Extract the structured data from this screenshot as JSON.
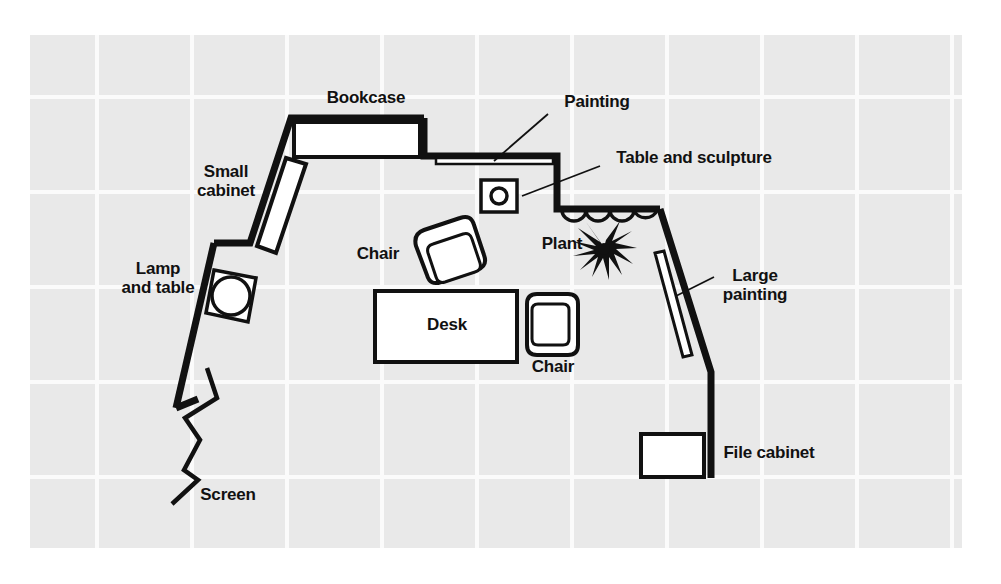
{
  "diagram": {
    "type": "floor-plan",
    "background": {
      "paper_color": "#ffffff",
      "grid_fill": "#e8e8e8",
      "grid_line_color": "#fbfbfb",
      "grid_cell_px": 95,
      "area": {
        "x": 30,
        "y": 35,
        "width": 932,
        "height": 513
      }
    },
    "stroke_color": "#111111",
    "wall_thickness_px": 7,
    "labels": [
      {
        "id": "bookcase",
        "text": "Bookcase",
        "x": 366,
        "y": 97,
        "align": "center"
      },
      {
        "id": "painting",
        "text": "Painting",
        "x": 597,
        "y": 101,
        "align": "center"
      },
      {
        "id": "table-and-sculpture",
        "text": "Table and sculpture",
        "x": 694,
        "y": 157,
        "align": "center"
      },
      {
        "id": "small-cabinet",
        "text": "Small\ncabinet",
        "x": 226,
        "y": 171,
        "align": "center"
      },
      {
        "id": "lamp-and-table",
        "text": "Lamp\nand table",
        "x": 158,
        "y": 268,
        "align": "center"
      },
      {
        "id": "chair-top",
        "text": "Chair",
        "x": 378,
        "y": 253,
        "align": "center"
      },
      {
        "id": "plant",
        "text": "Plant",
        "x": 562,
        "y": 243,
        "align": "center"
      },
      {
        "id": "large-painting",
        "text": "Large\npainting",
        "x": 755,
        "y": 275,
        "align": "center"
      },
      {
        "id": "desk",
        "text": "Desk",
        "x": 447,
        "y": 324,
        "align": "center"
      },
      {
        "id": "chair-right",
        "text": "Chair",
        "x": 553,
        "y": 366,
        "align": "center"
      },
      {
        "id": "file-cabinet",
        "text": "File cabinet",
        "x": 769,
        "y": 452,
        "align": "center"
      },
      {
        "id": "screen",
        "text": "Screen",
        "x": 228,
        "y": 494,
        "align": "center"
      }
    ],
    "furniture": [
      {
        "id": "bookcase",
        "shape": "rectangle",
        "note": "long rectangle along top wall"
      },
      {
        "id": "small-cabinet",
        "shape": "rectangle",
        "note": "tilted rectangle on angled upper-left wall"
      },
      {
        "id": "lamp-and-table",
        "shape": "square-with-circle",
        "note": "square table with round lamp"
      },
      {
        "id": "painting",
        "shape": "thin-strip",
        "note": "thin strip on upper-right wall"
      },
      {
        "id": "table-and-sculpture",
        "shape": "square-with-circle",
        "note": "small square with circle"
      },
      {
        "id": "plant",
        "shape": "starburst",
        "note": "spiky plant silhouette"
      },
      {
        "id": "curtain",
        "shape": "scallop",
        "note": "four scalloped arcs on wall"
      },
      {
        "id": "large-painting",
        "shape": "thin-strip",
        "note": "thin tilted strip on right wall"
      },
      {
        "id": "chair-top",
        "shape": "armchair",
        "note": "rotated armchair plan view"
      },
      {
        "id": "chair-right",
        "shape": "armchair",
        "note": "armchair plan view facing left"
      },
      {
        "id": "desk",
        "shape": "rectangle",
        "note": "large rectangle, center"
      },
      {
        "id": "file-cabinet",
        "shape": "rectangle",
        "note": "small rectangle by right wall"
      },
      {
        "id": "screen",
        "shape": "zigzag",
        "note": "folding accordion screen, lower left"
      }
    ]
  }
}
